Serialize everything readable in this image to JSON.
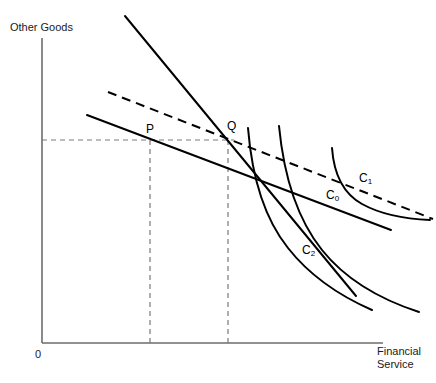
{
  "figure": {
    "type": "economics-indifference-curve-diagram",
    "background_color": "#ffffff",
    "line_color": "#000000",
    "axis_color": "#6d6d6d",
    "guide_color": "#7a7a7a"
  },
  "axes": {
    "y_label": "Other Goods",
    "x_label_line1": "Financial",
    "x_label_line2": "Service",
    "origin_label": "0",
    "y_axis": {
      "x": 42,
      "y_top": 38,
      "y_bottom": 343
    },
    "x_axis": {
      "y": 343,
      "x_left": 42,
      "x_right": 383
    }
  },
  "points": [
    {
      "name": "P",
      "label": "P",
      "x": 150,
      "y": 140
    },
    {
      "name": "Q",
      "label": "Q",
      "x": 231,
      "y": 140
    }
  ],
  "curve_labels": [
    {
      "name": "C0",
      "base": "C",
      "sub": "0",
      "x": 326,
      "y": 188
    },
    {
      "name": "C1",
      "base": "C",
      "sub": "1",
      "x": 359,
      "y": 171
    },
    {
      "name": "C2",
      "base": "C",
      "sub": "2",
      "x": 302,
      "y": 243
    }
  ],
  "budget_lines": [
    {
      "name": "steep-budget-line",
      "style": "solid",
      "from": {
        "x": 125,
        "y": 16
      },
      "to": {
        "x": 356,
        "y": 296
      }
    },
    {
      "name": "flat-budget-line",
      "style": "solid",
      "from": {
        "x": 87,
        "y": 115
      },
      "to": {
        "x": 391,
        "y": 230
      }
    },
    {
      "name": "compensated-budget-line",
      "style": "dashed",
      "from": {
        "x": 108,
        "y": 92
      },
      "to": {
        "x": 433,
        "y": 219
      }
    }
  ],
  "indifference_curves": [
    {
      "name": "C2-curve",
      "path": "M 248,128 C 252,178 264,218 288,248 C 310,276 340,296 372,310"
    },
    {
      "name": "C0-curve",
      "path": "M 279,126 C 284,178 298,220 322,250 C 346,280 382,300 419,312"
    },
    {
      "name": "C1-curve",
      "path": "M 332,148 C 334,176 344,194 362,204 C 382,215 406,219 430,220"
    }
  ],
  "guide_lines": [
    {
      "name": "horizontal-price-guide",
      "from": {
        "x": 42,
        "y": 140
      },
      "to": {
        "x": 234,
        "y": 140
      }
    },
    {
      "name": "vertical-guide-P",
      "from": {
        "x": 150,
        "y": 140
      },
      "to": {
        "x": 150,
        "y": 343
      }
    },
    {
      "name": "vertical-guide-Q",
      "from": {
        "x": 228,
        "y": 140
      },
      "to": {
        "x": 228,
        "y": 343
      }
    }
  ]
}
